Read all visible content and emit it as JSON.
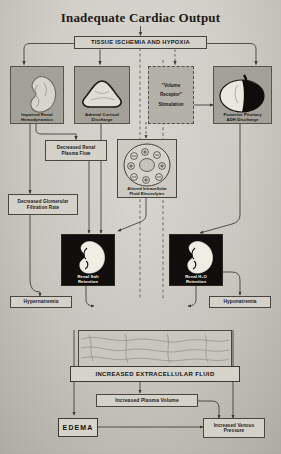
{
  "document": {
    "title": "Inadequate Cardiac Output",
    "type": "physiology-flowchart"
  },
  "nodes": {
    "root": "Inadequate Cardiac Output",
    "ischemia": "TISSUE ISCHEMIA AND HYPOXIA",
    "renal_hemodynamics": {
      "line1": "Impaired Renal",
      "line2": "Hemodynamics"
    },
    "adrenal": {
      "line1": "Adrenal Cortical",
      "line2": "Discharge"
    },
    "volume_receptor": {
      "line1": "\"Volume",
      "line2": "Receptor\"",
      "line3": "Stimulation"
    },
    "pituitary": {
      "line1": "Posterior Pituitary",
      "line2": "ADH Discharge"
    },
    "renal_plasma_flow": {
      "line1": "Decreased Renal",
      "line2": "Plasma Flow"
    },
    "gfr": {
      "line1": "Decreased Glomerular",
      "line2": "Filtration Rate"
    },
    "electrolytes": {
      "line1": "Altered Intracellular",
      "line2": "Fluid Electrolytes"
    },
    "salt_retention": {
      "line1": "Renal Salt",
      "line2": "Retention"
    },
    "water_retention": {
      "line1": "Renal H₂O",
      "line2": "Retention"
    },
    "hypernatremia": "Hypernatremia",
    "hyponatremia": "Hyponatremia",
    "ecf": "INCREASED EXTRACELLULAR FLUID",
    "plasma_volume": "Increased Plasma Volume",
    "edema": "EDEMA",
    "venous_pressure": {
      "line1": "Increased Venous",
      "line2": "Pressure"
    }
  },
  "cell_ions": [
    "⊖",
    "⊕",
    "⊖",
    "⊕",
    "⊕",
    "⊖",
    "⊕",
    "⊖"
  ],
  "icons": {
    "kidney": "kidney-icon",
    "adrenal": "adrenal-gland-icon",
    "pituitary": "pituitary-gland-icon",
    "cell": "cell-electrolyte-icon",
    "fluid": "extracellular-fluid-icon"
  },
  "colors": {
    "paper": "#cac7bf",
    "ink": "#22201c",
    "tile_bg": "#9e9b93",
    "dark_tile": "#100f0d",
    "line": "#4a4740"
  }
}
